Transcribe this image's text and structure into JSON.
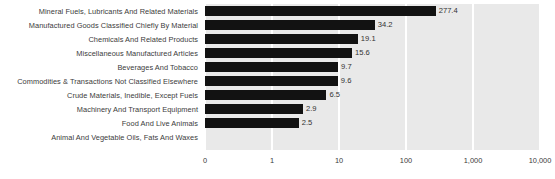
{
  "chart_data": {
    "type": "bar",
    "orientation": "horizontal",
    "title": "",
    "subtitle": "",
    "xlabel": "",
    "ylabel": "",
    "xscale": "log",
    "grid": true,
    "legend": false,
    "xticks": [
      "0",
      "1",
      "10",
      "100",
      "1,000",
      "10,000"
    ],
    "xtick_values": [
      0,
      1,
      10,
      100,
      1000,
      10000
    ],
    "xlim": [
      0,
      10000
    ],
    "categories": [
      "Mineral Fuels, Lubricants And Related Materials",
      "Manufactured Goods Classified Chiefly By Material",
      "Chemicals And Related Products",
      "Miscellaneous Manufactured Articles",
      "Beverages And Tobacco",
      "Commodities & Transactions Not Classified Elsewhere",
      "Crude Materials, Inedible, Except Fuels",
      "Machinery And Transport Equipment",
      "Food And Live Animals",
      "Animal And Vegetable Oils, Fats And Waxes"
    ],
    "values": [
      277.4,
      34.2,
      19.1,
      15.6,
      9.7,
      9.6,
      6.5,
      2.9,
      2.5,
      0
    ],
    "value_labels": [
      "277.4",
      "34.2",
      "19.1",
      "15.6",
      "9.7",
      "9.6",
      "6.5",
      "2.9",
      "2.5",
      ""
    ],
    "colors": {
      "bar": "#121212",
      "plot_background": "#e9e9e9",
      "page_background": "#ffffff",
      "gridline": "#ffffff",
      "text": "#3b3b3b"
    }
  }
}
